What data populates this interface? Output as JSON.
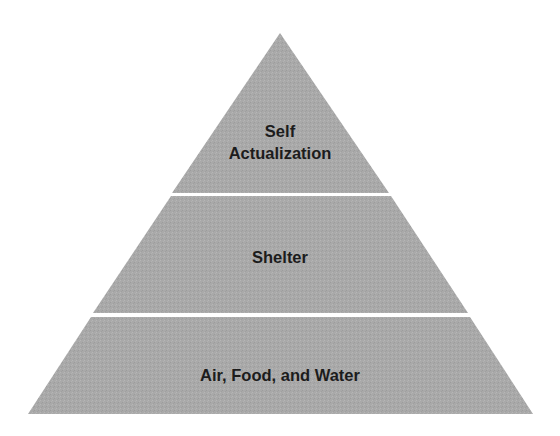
{
  "diagram": {
    "type": "pyramid",
    "fill_color": "#a9a9a9",
    "divider_color": "#ffffff",
    "text_color": "#1c1c1c",
    "levels": [
      {
        "position": "top",
        "lines": [
          "Self",
          "Actualization"
        ]
      },
      {
        "position": "middle",
        "lines": [
          "Shelter"
        ]
      },
      {
        "position": "bottom",
        "lines": [
          "Air, Food, and Water"
        ]
      }
    ]
  }
}
